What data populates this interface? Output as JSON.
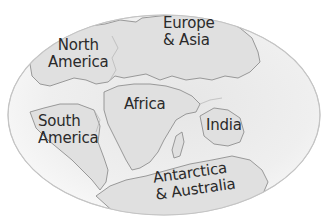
{
  "map": {
    "projection": "elliptical",
    "colors": {
      "ocean": "#eeeeee",
      "land": "#e2e2e2",
      "outline": "#8a8a8a",
      "border": "#c8c8c8",
      "text": "#2a2a2a"
    },
    "labels": {
      "north_america": [
        "North",
        "America"
      ],
      "europe_asia": [
        "Europe",
        "& Asia"
      ],
      "africa": [
        "Africa"
      ],
      "south_america": [
        "South",
        "America"
      ],
      "india": [
        "India"
      ],
      "antarctica_australia": [
        "Antarctica",
        "& Australia"
      ]
    }
  }
}
